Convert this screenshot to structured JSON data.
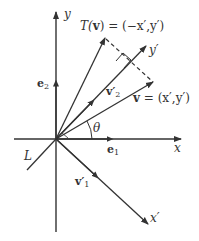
{
  "diagram": {
    "labels": {
      "y_axis": "y",
      "x_axis": "x",
      "y_prime": "y′",
      "x_prime": "x′",
      "transform": "T(v) = (−x′,y′)",
      "transform_T": "T(",
      "transform_v": "v",
      "transform_rest": ") = (−x′,y′)",
      "v_vec": "v",
      "v_rest": " = (x′,y′)",
      "e1": "e",
      "e1_sub": "1",
      "e2": "e",
      "e2_sub": "2",
      "v1p": "v′",
      "v1p_sub": "1",
      "v2p": "v′",
      "v2p_sub": "2",
      "theta": "θ",
      "line_L": "L"
    },
    "colors": {
      "stroke": "#333333",
      "background": "#ffffff"
    }
  }
}
